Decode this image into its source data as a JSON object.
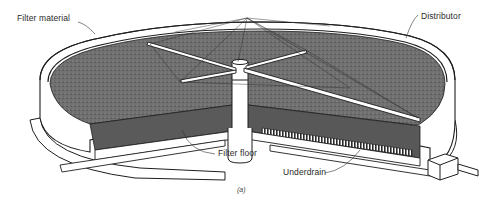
{
  "figure": {
    "caption": "(a)",
    "labels": {
      "filter_material": "Filter material",
      "distributor": "Distributor",
      "filter_floor": "Filter floor",
      "underdrain": "Underdrain"
    },
    "colors": {
      "media": "#6b6b6b",
      "media_dark": "#4a4a4a",
      "line": "#1e1e1e",
      "wall": "#ffffff",
      "background": "#ffffff"
    }
  }
}
